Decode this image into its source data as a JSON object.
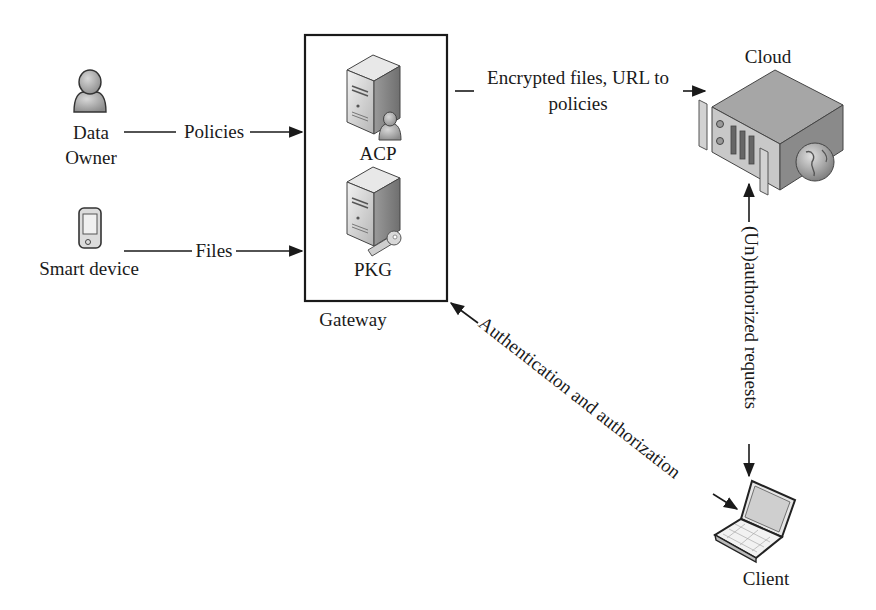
{
  "nodes": {
    "data_owner": {
      "line1": "Data",
      "line2": "Owner",
      "icon": "user-icon"
    },
    "smart_device": {
      "label": "Smart device",
      "icon": "smartphone-icon"
    },
    "gateway": {
      "label": "Gateway",
      "components": [
        {
          "label": "ACP",
          "icon": "server-user-icon"
        },
        {
          "label": "PKG",
          "icon": "server-key-icon"
        }
      ]
    },
    "cloud": {
      "label": "Cloud",
      "icon": "rack-server-globe-icon"
    },
    "client": {
      "label": "Client",
      "icon": "laptop-icon"
    }
  },
  "edges": {
    "policies": {
      "label": "Policies",
      "from": "Data Owner",
      "to": "Gateway"
    },
    "files": {
      "label": "Files",
      "from": "Smart device",
      "to": "Gateway"
    },
    "encrypted": {
      "line1": "Encrypted files, URL to",
      "line2": "policies",
      "from": "Gateway",
      "to": "Cloud"
    },
    "unauthorized": {
      "label": "(Un)authorized requests",
      "from": "Cloud",
      "to": "Client",
      "bidirectional": true
    },
    "auth": {
      "label": "Authentication and authorization",
      "from": "Client",
      "to": "Gateway",
      "bidirectional": true
    }
  },
  "colors": {
    "stroke": "#1a1a1a",
    "icon_fill": "#b8b8b8",
    "icon_dark": "#8a8a8a",
    "background": "#ffffff"
  }
}
